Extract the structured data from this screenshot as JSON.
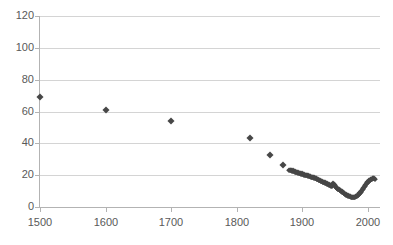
{
  "chart_data": {
    "type": "scatter",
    "title": "",
    "xlabel": "",
    "ylabel": "",
    "xlim": [
      1500,
      2010
    ],
    "ylim": [
      0,
      120
    ],
    "grid": true,
    "legend": false,
    "x_ticks": [
      "1500",
      "1600",
      "1700",
      "1800",
      "1900",
      "2000"
    ],
    "x_tick_values": [
      1500,
      1600,
      1700,
      1800,
      1900,
      2000
    ],
    "y_ticks": [
      "0",
      "20",
      "40",
      "60",
      "80",
      "100",
      "120"
    ],
    "y_tick_values": [
      0,
      20,
      40,
      60,
      80,
      100,
      120
    ],
    "marker_color": "#474747",
    "gridline_color": "#d4d4d4",
    "axis_color": "#b3b3b3",
    "tick_label_color": "#595959",
    "series": [
      {
        "name": "series-1",
        "points": [
          [
            1500,
            69.0
          ],
          [
            1600,
            60.8
          ],
          [
            1700,
            54.0
          ],
          [
            1820,
            43.6
          ],
          [
            1850,
            32.8
          ],
          [
            1870,
            26.2
          ],
          [
            1880,
            23.4
          ],
          [
            1881,
            23.2
          ],
          [
            1882,
            23.5
          ],
          [
            1883,
            23.0
          ],
          [
            1884,
            22.8
          ],
          [
            1885,
            23.1
          ],
          [
            1886,
            22.6
          ],
          [
            1887,
            22.4
          ],
          [
            1888,
            22.7
          ],
          [
            1889,
            22.2
          ],
          [
            1890,
            22.0
          ],
          [
            1891,
            22.3
          ],
          [
            1892,
            21.8
          ],
          [
            1893,
            21.6
          ],
          [
            1894,
            21.9
          ],
          [
            1895,
            21.4
          ],
          [
            1896,
            21.2
          ],
          [
            1897,
            21.5
          ],
          [
            1898,
            21.0
          ],
          [
            1899,
            20.8
          ],
          [
            1900,
            21.1
          ],
          [
            1901,
            20.6
          ],
          [
            1902,
            20.4
          ],
          [
            1903,
            20.7
          ],
          [
            1904,
            20.2
          ],
          [
            1905,
            20.0
          ],
          [
            1906,
            20.3
          ],
          [
            1907,
            19.8
          ],
          [
            1908,
            19.6
          ],
          [
            1909,
            19.9
          ],
          [
            1910,
            19.4
          ],
          [
            1911,
            19.2
          ],
          [
            1912,
            19.5
          ],
          [
            1913,
            19.0
          ],
          [
            1914,
            18.8
          ],
          [
            1915,
            19.1
          ],
          [
            1916,
            18.6
          ],
          [
            1917,
            18.4
          ],
          [
            1918,
            18.7
          ],
          [
            1919,
            18.2
          ],
          [
            1920,
            18.0
          ],
          [
            1921,
            18.3
          ],
          [
            1922,
            17.8
          ],
          [
            1923,
            17.6
          ],
          [
            1924,
            17.4
          ],
          [
            1925,
            17.2
          ],
          [
            1926,
            17.0
          ],
          [
            1927,
            16.8
          ],
          [
            1928,
            16.6
          ],
          [
            1929,
            16.4
          ],
          [
            1930,
            16.2
          ],
          [
            1931,
            16.0
          ],
          [
            1932,
            15.8
          ],
          [
            1933,
            15.6
          ],
          [
            1934,
            15.4
          ],
          [
            1935,
            15.2
          ],
          [
            1936,
            15.0
          ],
          [
            1937,
            14.8
          ],
          [
            1938,
            14.6
          ],
          [
            1939,
            14.4
          ],
          [
            1940,
            14.2
          ],
          [
            1941,
            14.0
          ],
          [
            1942,
            13.8
          ],
          [
            1943,
            13.6
          ],
          [
            1944,
            13.4
          ],
          [
            1945,
            13.2
          ],
          [
            1946,
            14.6
          ],
          [
            1947,
            14.8
          ],
          [
            1948,
            14.2
          ],
          [
            1949,
            13.6
          ],
          [
            1950,
            13.0
          ],
          [
            1951,
            12.6
          ],
          [
            1952,
            12.2
          ],
          [
            1953,
            11.9
          ],
          [
            1954,
            11.6
          ],
          [
            1955,
            11.3
          ],
          [
            1956,
            11.0
          ],
          [
            1957,
            10.7
          ],
          [
            1958,
            10.4
          ],
          [
            1959,
            10.1
          ],
          [
            1960,
            9.8
          ],
          [
            1961,
            9.5
          ],
          [
            1962,
            9.2
          ],
          [
            1963,
            8.9
          ],
          [
            1964,
            8.6
          ],
          [
            1965,
            8.3
          ],
          [
            1966,
            8.0
          ],
          [
            1967,
            7.8
          ],
          [
            1968,
            7.6
          ],
          [
            1969,
            7.4
          ],
          [
            1970,
            7.2
          ],
          [
            1971,
            7.0
          ],
          [
            1972,
            6.8
          ],
          [
            1973,
            6.6
          ],
          [
            1974,
            6.5
          ],
          [
            1975,
            6.4
          ],
          [
            1976,
            6.3
          ],
          [
            1977,
            6.2
          ],
          [
            1978,
            6.2
          ],
          [
            1979,
            6.3
          ],
          [
            1980,
            6.4
          ],
          [
            1981,
            6.6
          ],
          [
            1982,
            6.8
          ],
          [
            1983,
            7.1
          ],
          [
            1984,
            7.4
          ],
          [
            1985,
            7.8
          ],
          [
            1986,
            8.2
          ],
          [
            1987,
            8.6
          ],
          [
            1988,
            9.1
          ],
          [
            1989,
            9.6
          ],
          [
            1990,
            10.1
          ],
          [
            1991,
            10.7
          ],
          [
            1992,
            11.3
          ],
          [
            1993,
            11.9
          ],
          [
            1994,
            12.5
          ],
          [
            1995,
            13.1
          ],
          [
            1996,
            13.7
          ],
          [
            1997,
            14.3
          ],
          [
            1998,
            14.9
          ],
          [
            1999,
            15.4
          ],
          [
            2000,
            15.9
          ],
          [
            2001,
            16.3
          ],
          [
            2002,
            16.7
          ],
          [
            2003,
            17.0
          ],
          [
            2004,
            17.3
          ],
          [
            2005,
            17.6
          ],
          [
            2006,
            17.8
          ],
          [
            2007,
            18.0
          ],
          [
            2008,
            18.2
          ],
          [
            2009,
            18.1
          ],
          [
            2010,
            17.9
          ]
        ]
      }
    ]
  }
}
